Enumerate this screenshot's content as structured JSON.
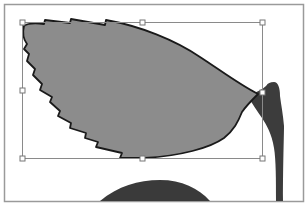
{
  "canvas": {
    "width": 308,
    "height": 213,
    "background": "#ffffff",
    "artboard_frame_color": "#9a9a9a"
  },
  "artwork": {
    "leaf": {
      "fill": "#8c8c8c",
      "stroke": "#1a1a1a",
      "selected": true
    },
    "stem": {
      "fill": "#3c3c3c"
    },
    "dome": {
      "fill": "#3a3a3a"
    }
  },
  "selection": {
    "bounding_box": {
      "x": 22,
      "y": 22,
      "width": 240,
      "height": 136
    },
    "line_color": "#8a8a8a",
    "handle_fill": "#ffffff",
    "handle_stroke": "#777777",
    "handles": [
      "top-left",
      "top-center",
      "top-right",
      "middle-left",
      "middle-right",
      "bottom-left",
      "bottom-center",
      "bottom-right"
    ]
  }
}
